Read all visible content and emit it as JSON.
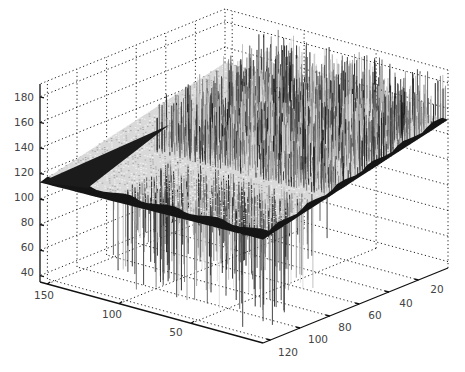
{
  "chart_data": {
    "type": "surface3d",
    "title": "",
    "xlabel": "",
    "ylabel": "",
    "zlabel": "",
    "x_ticks": [
      50,
      100,
      150
    ],
    "y_ticks": [
      20,
      40,
      60,
      80,
      100,
      120
    ],
    "z_ticks": [
      40,
      60,
      80,
      100,
      120,
      140,
      160,
      180
    ],
    "xlim": [
      0,
      155
    ],
    "ylim": [
      0,
      125
    ],
    "zlim": [
      35,
      190
    ],
    "grid": true,
    "legend": null,
    "colormap": "gray",
    "base_plane_level": 120,
    "spike_max": 185,
    "spike_min": 40
  },
  "axes": {
    "z_labels": [
      "180",
      "160",
      "140",
      "120",
      "100",
      "80",
      "60",
      "40"
    ],
    "x_labels": [
      "150",
      "100",
      "50"
    ],
    "y_labels": [
      "120",
      "100",
      "80",
      "60",
      "40",
      "20"
    ]
  }
}
